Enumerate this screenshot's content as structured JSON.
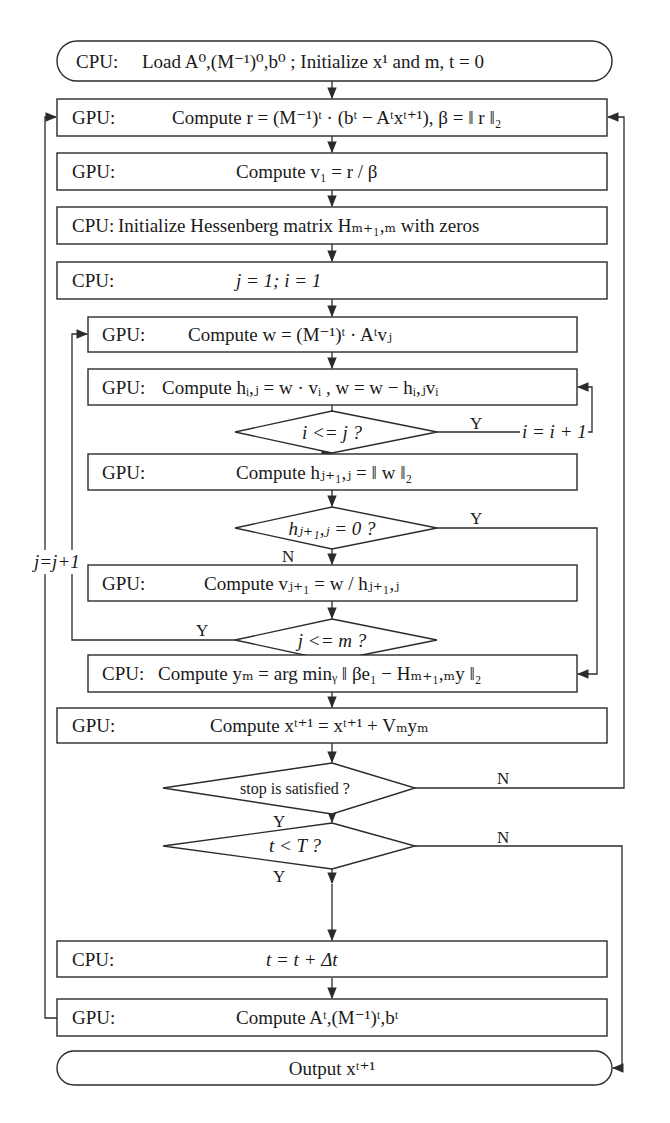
{
  "diagram": {
    "type": "flowchart",
    "colors": {
      "stroke": "#2b2b2b",
      "fill": "#ffffff",
      "text": "#1a1a1a"
    },
    "nodes": {
      "start": {
        "shape": "terminator",
        "unit": "CPU:",
        "text": "Load A⁰,(M⁻¹)⁰,b⁰ ; Initialize x¹ and m, t = 0"
      },
      "compute_r": {
        "shape": "process",
        "unit": "GPU:",
        "text": "Compute r = (M⁻¹)ᵗ · (bᵗ − Aᵗxᵗ⁺¹), β = ‖ r ‖₂"
      },
      "compute_v1": {
        "shape": "process",
        "unit": "GPU:",
        "text": "Compute v₁ = r / β"
      },
      "init_hessenberg": {
        "shape": "process",
        "unit": "CPU:",
        "text": "Initialize Hessenberg matrix Hₘ₊₁,ₘ with zeros"
      },
      "init_ij": {
        "shape": "process",
        "unit": "CPU:",
        "text": "j = 1; i = 1"
      },
      "compute_w": {
        "shape": "process",
        "unit": "GPU:",
        "text": "Compute w = (M⁻¹)ᵗ · Aᵗvⱼ"
      },
      "compute_hij": {
        "shape": "process",
        "unit": "GPU:",
        "text": "Compute hᵢ,ⱼ = w · vᵢ , w = w − hᵢ,ⱼvᵢ"
      },
      "check_i_le_j": {
        "shape": "decision",
        "text": "i <= j ?"
      },
      "compute_hj1j": {
        "shape": "process",
        "unit": "GPU:",
        "text": "Compute hⱼ₊₁,ⱼ = ‖ w ‖₂"
      },
      "check_h_zero": {
        "shape": "decision",
        "text": "hⱼ₊₁,ⱼ = 0 ?"
      },
      "compute_vj1": {
        "shape": "process",
        "unit": "GPU:",
        "text": "Compute vⱼ₊₁ = w / hⱼ₊₁,ⱼ"
      },
      "check_j_le_m": {
        "shape": "decision",
        "text": "j <= m ?"
      },
      "compute_ym": {
        "shape": "process",
        "unit": "CPU:",
        "text": "Compute yₘ = arg minᵧ ‖ βe₁ − Hₘ₊₁,ₘy ‖₂"
      },
      "compute_xt1": {
        "shape": "process",
        "unit": "GPU:",
        "text": "Compute xᵗ⁺¹ = xᵗ⁺¹ + Vₘyₘ"
      },
      "check_stop": {
        "shape": "decision",
        "text": "stop is satisfied ?"
      },
      "check_t_lt_T": {
        "shape": "decision",
        "text": "t < T ?"
      },
      "update_t": {
        "shape": "process",
        "unit": "CPU:",
        "text": "t = t + Δt"
      },
      "compute_At": {
        "shape": "process",
        "unit": "GPU:",
        "text": "Compute Aᵗ,(M⁻¹)ᵗ,bᵗ"
      },
      "output": {
        "shape": "terminator",
        "text": "Output xᵗ⁺¹"
      }
    },
    "edge_labels": {
      "i_le_j_yes": "Y",
      "i_le_j_no": "N",
      "i_increment": "i = i + 1",
      "h_zero_yes": "Y",
      "h_zero_no": "N",
      "j_le_m_yes": "Y",
      "j_le_m_no": "N",
      "j_increment": "j=j+1",
      "stop_no": "N",
      "stop_yes": "Y",
      "t_lt_T_no": "N",
      "t_lt_T_yes": "Y"
    },
    "edges": [
      [
        "start",
        "compute_r"
      ],
      [
        "compute_r",
        "compute_v1"
      ],
      [
        "compute_v1",
        "init_hessenberg"
      ],
      [
        "init_hessenberg",
        "init_ij"
      ],
      [
        "init_ij",
        "compute_w"
      ],
      [
        "compute_w",
        "compute_hij"
      ],
      [
        "compute_hij",
        "check_i_le_j"
      ],
      [
        "check_i_le_j",
        "compute_hij",
        "Y (i = i + 1)"
      ],
      [
        "check_i_le_j",
        "compute_hj1j",
        "N"
      ],
      [
        "compute_hj1j",
        "check_h_zero"
      ],
      [
        "check_h_zero",
        "compute_ym",
        "Y"
      ],
      [
        "check_h_zero",
        "compute_vj1",
        "N"
      ],
      [
        "compute_vj1",
        "check_j_le_m"
      ],
      [
        "check_j_le_m",
        "compute_w",
        "Y (j=j+1)"
      ],
      [
        "check_j_le_m",
        "compute_ym",
        "N"
      ],
      [
        "compute_ym",
        "compute_xt1"
      ],
      [
        "compute_xt1",
        "check_stop"
      ],
      [
        "check_stop",
        "compute_r",
        "N"
      ],
      [
        "check_stop",
        "check_t_lt_T",
        "Y"
      ],
      [
        "check_t_lt_T",
        "output",
        "N"
      ],
      [
        "check_t_lt_T",
        "update_t",
        "Y"
      ],
      [
        "update_t",
        "compute_At"
      ],
      [
        "compute_At",
        "compute_r"
      ]
    ]
  }
}
